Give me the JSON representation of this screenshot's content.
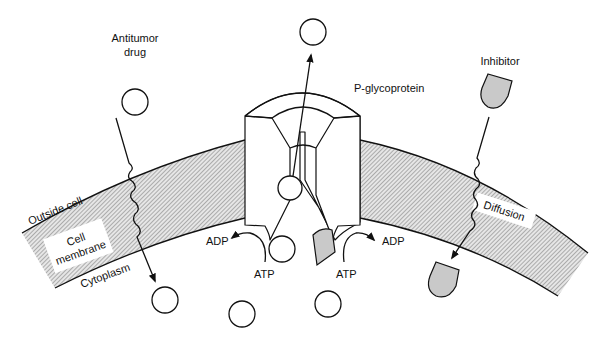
{
  "labels": {
    "antitumor_drug_line1": "Antitumor",
    "antitumor_drug_line2": "drug",
    "p_glycoprotein": "P-glycoprotein",
    "inhibitor": "Inhibitor",
    "outside_cell": "Outside cell",
    "cell_membrane_line1": "Cell",
    "cell_membrane_line2": "membrane",
    "cytoplasm": "Cytoplasm",
    "diffusion": "Diffusion",
    "adp_left": "ADP",
    "adp_right": "ADP",
    "atp_left": "ATP",
    "atp_right": "ATP"
  },
  "colors": {
    "line": "#111111",
    "membrane_hatch": "#8a8a8a",
    "inhibitor_fill": "#c9c9c9",
    "background": "#ffffff"
  },
  "molecules": {
    "drug": [
      {
        "id": "drug-outside-left",
        "cx": 135,
        "cy": 76,
        "r": 13
      },
      {
        "id": "drug-expelled-top",
        "cx": 313,
        "cy": 32,
        "r": 13
      },
      {
        "id": "drug-in-pump",
        "cx": 290,
        "cy": 188,
        "r": 12
      },
      {
        "id": "drug-at-pump-entry",
        "cx": 282,
        "cy": 249,
        "r": 13
      },
      {
        "id": "drug-cytoplasm-left",
        "cx": 165,
        "cy": 300,
        "r": 13
      },
      {
        "id": "drug-cytoplasm-bottom-1",
        "cx": 242,
        "cy": 314,
        "r": 13
      },
      {
        "id": "drug-cytoplasm-bottom-2",
        "cx": 328,
        "cy": 304,
        "r": 13
      }
    ],
    "inhibitor": [
      {
        "id": "inhibitor-outside",
        "x": 482,
        "y": 76
      },
      {
        "id": "inhibitor-at-pump",
        "x": 312,
        "y": 237
      },
      {
        "id": "inhibitor-cytoplasm",
        "x": 431,
        "y": 262
      }
    ]
  }
}
